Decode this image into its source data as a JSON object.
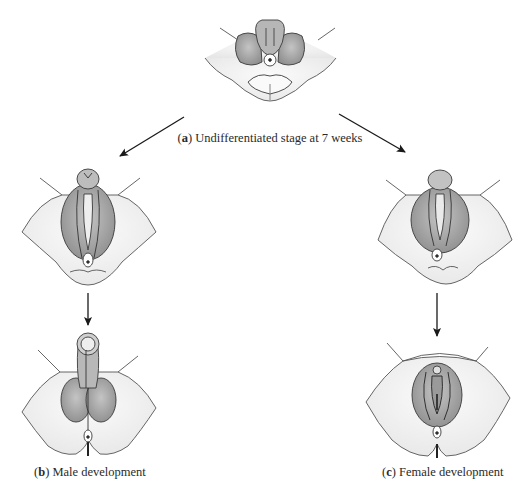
{
  "figure": {
    "panels": [
      {
        "id": "a",
        "letter": "a",
        "caption": "Undifferentiated stage at 7 weeks"
      },
      {
        "id": "b",
        "letter": "b",
        "caption": "Male development"
      },
      {
        "id": "c",
        "letter": "c",
        "caption": "Female development"
      }
    ],
    "colors": {
      "line": "#3a3a3a",
      "shade": "#a8a8a8",
      "shade_light": "#d0d0d0",
      "skin": "#f4f4f4",
      "background": "#ffffff"
    }
  }
}
